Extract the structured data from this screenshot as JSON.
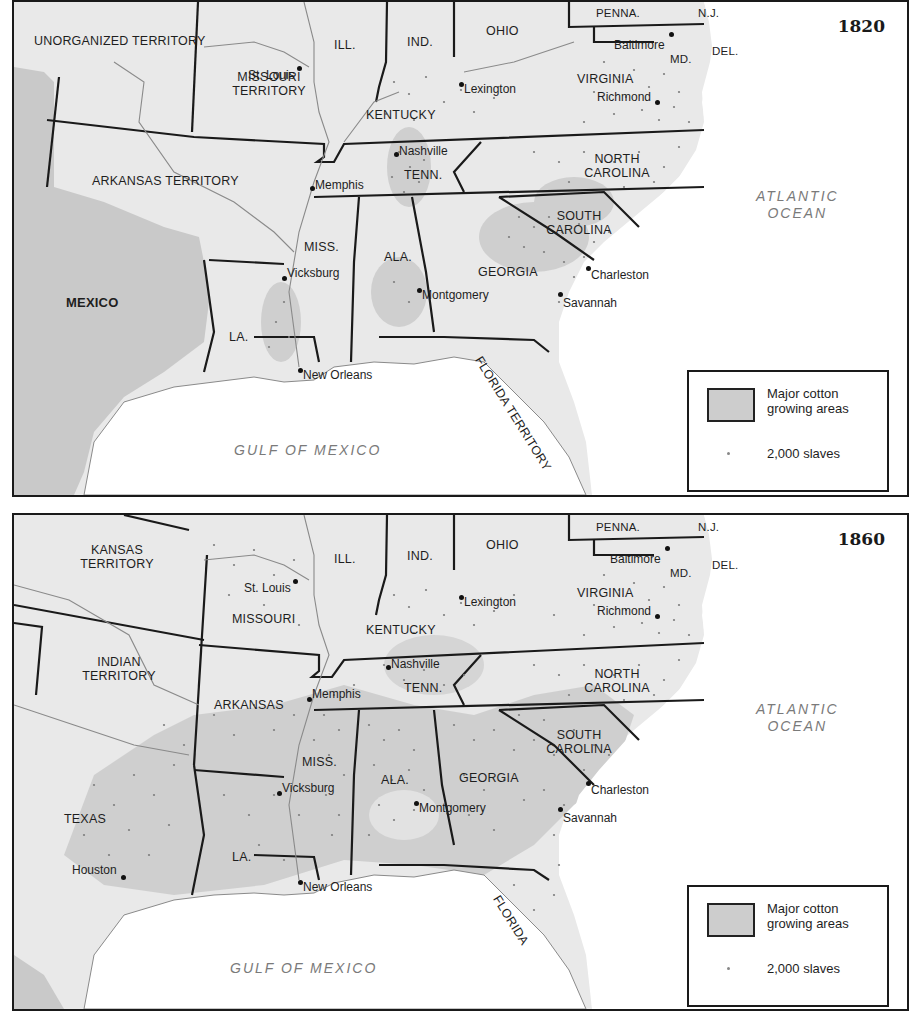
{
  "colors": {
    "land": "#e9e9e9",
    "mexico": "#c9c9c9",
    "water": "#ffffff",
    "cotton_area": "#cfcfcf",
    "borders": "#1a1a1a",
    "rivers": "#8a8a8a",
    "dots": "#7d7d7d"
  },
  "maps": [
    {
      "year": "1820",
      "regions": {
        "unorganized": "UNORGANIZED TERRITORY",
        "missouri": "MISSOURI TERRITORY",
        "arkansas": "ARKANSAS TERRITORY",
        "ill": "ILL.",
        "ind": "IND.",
        "ohio": "OHIO",
        "penna": "PENNA.",
        "nj": "N.J.",
        "del": "DEL.",
        "md": "MD.",
        "virginia": "VIRGINIA",
        "kentucky": "KENTUCKY",
        "tenn": "TENN.",
        "north_carolina": "NORTH CAROLINA",
        "south_carolina": "SOUTH CAROLINA",
        "georgia": "GEORGIA",
        "ala": "ALA.",
        "miss": "MISS.",
        "la": "LA.",
        "florida": "FLORIDA TERRITORY",
        "mexico": "MEXICO"
      },
      "cities": {
        "st_louis": "St. Louis",
        "lexington": "Lexington",
        "baltimore": "Baltimore",
        "richmond": "Richmond",
        "nashville": "Nashville",
        "memphis": "Memphis",
        "vicksburg": "Vicksburg",
        "montgomery": "Montgomery",
        "charleston": "Charleston",
        "savannah": "Savannah",
        "new_orleans": "New Orleans"
      },
      "water": {
        "atlantic_1": "ATLANTIC",
        "atlantic_2": "OCEAN",
        "gulf": "GULF OF MEXICO"
      },
      "legend": {
        "cotton_1": "Major cotton",
        "cotton_2": "growing areas",
        "slaves": "2,000 slaves"
      }
    },
    {
      "year": "1860",
      "regions": {
        "kansas": "KANSAS TERRITORY",
        "indian": "INDIAN TERRITORY",
        "missouri": "MISSOURI",
        "arkansas": "ARKANSAS",
        "texas": "TEXAS",
        "ill": "ILL.",
        "ind": "IND.",
        "ohio": "OHIO",
        "penna": "PENNA.",
        "nj": "N.J.",
        "del": "DEL.",
        "md": "MD.",
        "virginia": "VIRGINIA",
        "kentucky": "KENTUCKY",
        "tenn": "TENN.",
        "north_carolina": "NORTH CAROLINA",
        "south_carolina": "SOUTH CAROLINA",
        "georgia": "GEORGIA",
        "ala": "ALA.",
        "miss": "MISS.",
        "la": "LA.",
        "florida": "FLORIDA"
      },
      "cities": {
        "st_louis": "St. Louis",
        "lexington": "Lexington",
        "baltimore": "Baltimore",
        "richmond": "Richmond",
        "nashville": "Nashville",
        "memphis": "Memphis",
        "vicksburg": "Vicksburg",
        "montgomery": "Montgomery",
        "charleston": "Charleston",
        "savannah": "Savannah",
        "new_orleans": "New Orleans",
        "houston": "Houston"
      },
      "water": {
        "atlantic_1": "ATLANTIC",
        "atlantic_2": "OCEAN",
        "gulf": "GULF OF MEXICO"
      },
      "legend": {
        "cotton_1": "Major cotton",
        "cotton_2": "growing areas",
        "slaves": "2,000 slaves"
      }
    }
  ]
}
